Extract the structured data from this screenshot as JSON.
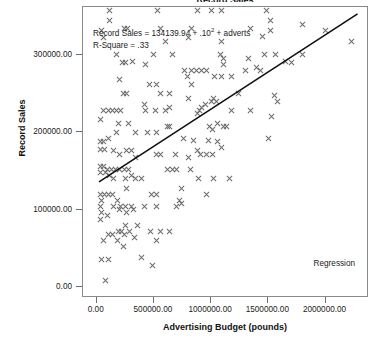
{
  "chart_data": {
    "type": "scatter",
    "title": "Record Sales",
    "xlabel": "Advertising Budget (pounds)",
    "ylabel": "Record Sales",
    "xlim": [
      -120000,
      2380000
    ],
    "ylim": [
      -14000,
      362000
    ],
    "xticks": [
      0,
      500000,
      1000000,
      1500000,
      2000000
    ],
    "xtick_labels": [
      "0.00",
      "500000.00",
      "1000000.00",
      "1500000.00",
      "2000000.00"
    ],
    "yticks": [
      0,
      100000,
      200000,
      300000
    ],
    "ytick_labels": [
      "0.00",
      "100000.00",
      "200000.00",
      "300000.00"
    ],
    "grid": false,
    "marker": "x-cross",
    "marker_color": "#6e6e6e",
    "line_color": "#111111",
    "frame_color": "#8a8a8a",
    "legend": "Regression",
    "legend_position": "bottom-right",
    "annotation_line1": "Record Sales = 134139.94 + .10",
    "annotation_exponent": "2",
    "annotation_line1_tail": " + adverts",
    "annotation_line2": "R-Square = .33",
    "regression": {
      "intercept": 134139.94,
      "slope": 0.096,
      "r_square": 0.33,
      "x_start": 20000,
      "x_end": 2280000,
      "y_start": 136060,
      "y_end": 353020
    },
    "points": [
      [
        110000,
        358000
      ],
      [
        530000,
        358000
      ],
      [
        880000,
        358000
      ],
      [
        1000000,
        358000
      ],
      [
        1090000,
        358000
      ],
      [
        1480000,
        358000
      ],
      [
        110000,
        344000
      ],
      [
        1520000,
        344000
      ],
      [
        40000,
        332000
      ],
      [
        240000,
        334000
      ],
      [
        265000,
        334000
      ],
      [
        560000,
        334000
      ],
      [
        830000,
        334000
      ],
      [
        1340000,
        334000
      ],
      [
        1520000,
        332000
      ],
      [
        1800000,
        340000
      ],
      [
        60000,
        322000
      ],
      [
        600000,
        318000
      ],
      [
        805000,
        322000
      ],
      [
        1090000,
        318000
      ],
      [
        1450000,
        324000
      ],
      [
        2230000,
        318000
      ],
      [
        2000000,
        332000
      ],
      [
        175000,
        300000
      ],
      [
        500000,
        300000
      ],
      [
        660000,
        300000
      ],
      [
        1080000,
        300000
      ],
      [
        1105000,
        296000
      ],
      [
        1330000,
        296000
      ],
      [
        1470000,
        300000
      ],
      [
        1560000,
        300000
      ],
      [
        1800000,
        300000
      ],
      [
        1650000,
        292000
      ],
      [
        225000,
        290000
      ],
      [
        255000,
        290000
      ],
      [
        430000,
        288000
      ],
      [
        1110000,
        288000
      ],
      [
        1700000,
        290000
      ],
      [
        310000,
        292000
      ],
      [
        830000,
        280000
      ],
      [
        875000,
        280000
      ],
      [
        920000,
        280000
      ],
      [
        960000,
        280000
      ],
      [
        770000,
        280000
      ],
      [
        1300000,
        280000
      ],
      [
        1400000,
        284000
      ],
      [
        1430000,
        280000
      ],
      [
        790000,
        272000
      ],
      [
        1030000,
        272000
      ],
      [
        1090000,
        272000
      ],
      [
        1180000,
        272000
      ],
      [
        200000,
        268000
      ],
      [
        460000,
        262000
      ],
      [
        520000,
        262000
      ],
      [
        830000,
        262000
      ],
      [
        230000,
        250000
      ],
      [
        260000,
        250000
      ],
      [
        560000,
        250000
      ],
      [
        640000,
        250000
      ],
      [
        1240000,
        250000
      ],
      [
        1550000,
        248000
      ],
      [
        1580000,
        240000
      ],
      [
        1000000,
        240000
      ],
      [
        1020000,
        244000
      ],
      [
        1050000,
        240000
      ],
      [
        800000,
        244000
      ],
      [
        950000,
        236000
      ],
      [
        420000,
        236000
      ],
      [
        430000,
        228000
      ],
      [
        510000,
        228000
      ],
      [
        600000,
        228000
      ],
      [
        640000,
        232000
      ],
      [
        900000,
        228000
      ],
      [
        920000,
        232000
      ],
      [
        880000,
        224000
      ],
      [
        1180000,
        228000
      ],
      [
        1340000,
        228000
      ],
      [
        1530000,
        220000
      ],
      [
        55000,
        228000
      ],
      [
        100000,
        228000
      ],
      [
        135000,
        228000
      ],
      [
        170000,
        228000
      ],
      [
        205000,
        228000
      ],
      [
        30000,
        216000
      ],
      [
        190000,
        212000
      ],
      [
        280000,
        212000
      ],
      [
        1060000,
        212000
      ],
      [
        1110000,
        208000
      ],
      [
        1130000,
        208000
      ],
      [
        990000,
        208000
      ],
      [
        620000,
        208000
      ],
      [
        640000,
        208000
      ],
      [
        1010000,
        204000
      ],
      [
        1500000,
        192000
      ],
      [
        170000,
        200000
      ],
      [
        340000,
        200000
      ],
      [
        440000,
        200000
      ],
      [
        520000,
        200000
      ],
      [
        100000,
        192000
      ],
      [
        30000,
        188000
      ],
      [
        60000,
        188000
      ],
      [
        980000,
        190000
      ],
      [
        760000,
        192000
      ],
      [
        850000,
        190000
      ],
      [
        1060000,
        188000
      ],
      [
        1090000,
        180000
      ],
      [
        30000,
        178000
      ],
      [
        70000,
        178000
      ],
      [
        150000,
        176000
      ],
      [
        260000,
        176000
      ],
      [
        300000,
        176000
      ],
      [
        880000,
        176000
      ],
      [
        910000,
        172000
      ],
      [
        960000,
        172000
      ],
      [
        1010000,
        172000
      ],
      [
        520000,
        172000
      ],
      [
        560000,
        172000
      ],
      [
        690000,
        172000
      ],
      [
        800000,
        168000
      ],
      [
        200000,
        172000
      ],
      [
        340000,
        168000
      ],
      [
        30000,
        156000
      ],
      [
        60000,
        156000
      ],
      [
        95000,
        152000
      ],
      [
        130000,
        152000
      ],
      [
        165000,
        152000
      ],
      [
        200000,
        152000
      ],
      [
        240000,
        152000
      ],
      [
        280000,
        152000
      ],
      [
        30000,
        148000
      ],
      [
        75000,
        148000
      ],
      [
        115000,
        144000
      ],
      [
        300000,
        144000
      ],
      [
        340000,
        140000
      ],
      [
        620000,
        152000
      ],
      [
        660000,
        152000
      ],
      [
        700000,
        152000
      ],
      [
        820000,
        152000
      ],
      [
        150000,
        140000
      ],
      [
        250000,
        140000
      ],
      [
        390000,
        140000
      ],
      [
        1020000,
        140000
      ],
      [
        1160000,
        140000
      ],
      [
        890000,
        140000
      ],
      [
        30000,
        120000
      ],
      [
        70000,
        120000
      ],
      [
        105000,
        120000
      ],
      [
        140000,
        120000
      ],
      [
        40000,
        112000
      ],
      [
        180000,
        112000
      ],
      [
        480000,
        120000
      ],
      [
        520000,
        120000
      ],
      [
        720000,
        112000
      ],
      [
        960000,
        120000
      ],
      [
        740000,
        128000
      ],
      [
        260000,
        128000
      ],
      [
        30000,
        104000
      ],
      [
        150000,
        104000
      ],
      [
        210000,
        104000
      ],
      [
        255000,
        104000
      ],
      [
        300000,
        104000
      ],
      [
        420000,
        104000
      ],
      [
        520000,
        104000
      ],
      [
        700000,
        104000
      ],
      [
        740000,
        108000
      ],
      [
        40000,
        96000
      ],
      [
        90000,
        92000
      ],
      [
        200000,
        100000
      ],
      [
        260000,
        96000
      ],
      [
        320000,
        100000
      ],
      [
        30000,
        88000
      ],
      [
        250000,
        80000
      ],
      [
        360000,
        80000
      ],
      [
        190000,
        72000
      ],
      [
        220000,
        72000
      ],
      [
        290000,
        72000
      ],
      [
        470000,
        72000
      ],
      [
        560000,
        72000
      ],
      [
        640000,
        72000
      ],
      [
        105000,
        68000
      ],
      [
        140000,
        68000
      ],
      [
        240000,
        68000
      ],
      [
        330000,
        64000
      ],
      [
        60000,
        60000
      ],
      [
        180000,
        60000
      ],
      [
        520000,
        60000
      ],
      [
        230000,
        52000
      ],
      [
        40000,
        36000
      ],
      [
        100000,
        36000
      ],
      [
        390000,
        38000
      ],
      [
        490000,
        28000
      ],
      [
        80000,
        8000
      ]
    ]
  }
}
